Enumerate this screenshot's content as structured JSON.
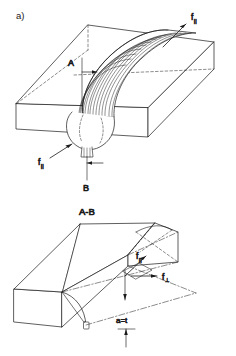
{
  "figure": {
    "panel_label": "a)",
    "section_title": "A-B",
    "stroke_color": "#1a1a1a",
    "fill_color": "#ffffff",
    "background": "#ffffff",
    "hidden_line_style": "dashed",
    "axis_line_style": "dash-dot"
  },
  "top_view": {
    "name": "isometric-welded-plate",
    "section_marker_a": "A",
    "section_marker_b": "B",
    "force_top": {
      "symbol": "f",
      "subscript": "||",
      "text": "f"
    },
    "force_bottom": {
      "symbol": "f",
      "subscript": "||",
      "text": "f"
    },
    "weld_ripple_count": 14,
    "weld_pool_shape": "teardrop"
  },
  "bottom_view": {
    "name": "section-a-b-view",
    "title": "A-B",
    "force_parallel": {
      "symbol": "f",
      "subscript": "||",
      "text": "f"
    },
    "force_perpendicular": {
      "symbol": "f",
      "subscript": "⊥",
      "text": "f"
    },
    "dimension": "a=t"
  }
}
